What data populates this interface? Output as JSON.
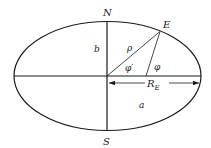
{
  "diagram": {
    "colors": {
      "stroke": "#1a1a1a",
      "background": "#ffffff",
      "text": "#222222"
    },
    "labels": {
      "north": "N",
      "south": "S",
      "point": "E",
      "semi_minor": "b",
      "semi_major": "a",
      "radius": "ρ",
      "geocentric_latitude": "φ′",
      "geodetic_latitude": "φ",
      "equatorial_radius_main": "R",
      "equatorial_radius_sub": "E"
    }
  }
}
